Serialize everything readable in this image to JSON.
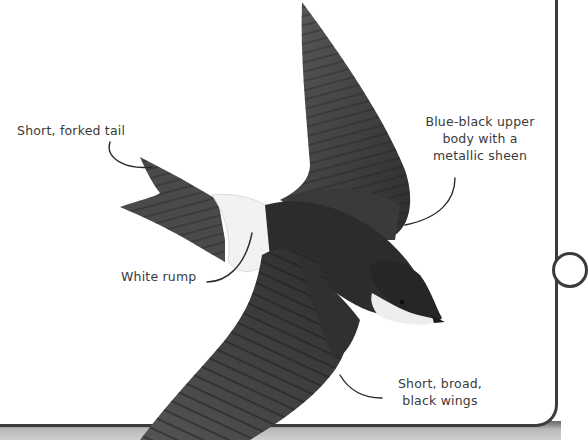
{
  "figure": {
    "annotations": [
      {
        "id": "tail",
        "text": "Short, forked tail"
      },
      {
        "id": "upper",
        "lines": [
          "Blue-black upper",
          "body with a",
          "metallic sheen"
        ]
      },
      {
        "id": "rump",
        "text": "White rump"
      },
      {
        "id": "wings",
        "lines": [
          "Short, broad,",
          "black wings"
        ]
      }
    ]
  },
  "colors": {
    "background": "#ffffff",
    "bird_dark": "#2a2a2a",
    "bird_feather": "#4a4a4a",
    "rump_white": "#f4f4f4",
    "label_text": "#3a3a3a",
    "panel_border": "#3b3b3b",
    "bottom_strip": "#b8b8b8"
  }
}
